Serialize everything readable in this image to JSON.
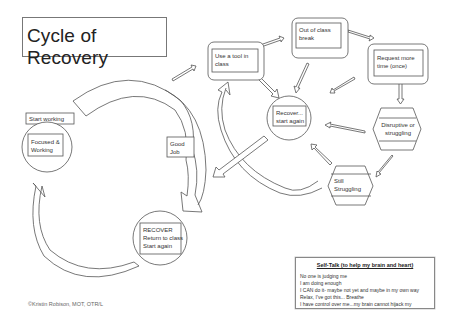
{
  "title": "Cycle of Recovery",
  "nodes": {
    "use_tool": {
      "label": "Use a tool in\nclass",
      "shape": "rounded-rect"
    },
    "out_of_class": {
      "label": "Out of class\nbreak",
      "shape": "rounded-rect"
    },
    "request_time": {
      "label": "Request more\ntime (once)",
      "shape": "rounded-rect"
    },
    "recover_start": {
      "label": "Recover...\nstart again",
      "shape": "circle"
    },
    "disruptive": {
      "label": "Disruptive or\nstruggling",
      "shape": "hexagon"
    },
    "still_struggling": {
      "label": "Still\nStruggling",
      "shape": "hexagon"
    },
    "start_working": {
      "label": "Start working",
      "shape": "rect"
    },
    "focused": {
      "label": "Focused &\nWorking",
      "shape": "circle"
    },
    "good_job": {
      "label": "Good\nJob",
      "shape": "rect"
    },
    "recover_return": {
      "label": "RECOVER\nReturn to class\nStart again",
      "shape": "circle"
    }
  },
  "edges": [
    {
      "from": "use_tool",
      "to": "out_of_class"
    },
    {
      "from": "out_of_class",
      "to": "request_time"
    },
    {
      "from": "request_time",
      "to": "disruptive"
    },
    {
      "from": "disruptive",
      "to": "still_struggling"
    },
    {
      "from": "use_tool",
      "to": "recover_start"
    },
    {
      "from": "out_of_class",
      "to": "recover_start"
    },
    {
      "from": "request_time",
      "to": "recover_start"
    },
    {
      "from": "disruptive",
      "to": "recover_start"
    },
    {
      "from": "still_struggling",
      "to": "recover_start"
    },
    {
      "from": "still_struggling",
      "to": "use_tool",
      "style": "curved"
    },
    {
      "from": "recover_start",
      "to": "recover_return"
    },
    {
      "from": "start_working",
      "to": "good_job",
      "style": "curved"
    },
    {
      "from": "good_job",
      "to": "recover_return",
      "style": "curved"
    },
    {
      "from": "recover_return",
      "to": "focused",
      "style": "curved"
    }
  ],
  "self_talk": {
    "heading": "Self-Talk (to help my brain and heart)",
    "lines": [
      "No one is judging me",
      "I am doing enough",
      "I CAN do it- maybe not yet and maybe in my own way",
      "Relax, I've got this... Breathe",
      "I have control over me...my brain cannot hijack my"
    ]
  },
  "credit": "©Kristin Robison, MOT, OTR/L",
  "colors": {
    "line": "#555555",
    "background": "#ffffff",
    "text": "#333333"
  }
}
